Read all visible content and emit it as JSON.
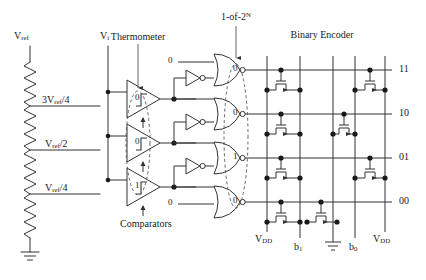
{
  "figure": {
    "kind": "flash-adc-schematic",
    "stroke_color": "#333333",
    "dash_color": "#555555",
    "text_color": "#1a1a1a"
  },
  "section_labels": {
    "thermometer": "Thermometer",
    "one_of_2n_prefix": "1-of-2",
    "one_of_2n_exponent": "N",
    "one_of_2n_mid": "-of-",
    "one_of_2n_lead": "1",
    "binary_encoder": "Binary Encoder",
    "comparators": "Comparators"
  },
  "inputs": {
    "vref_label_v": "V",
    "vref_label_sub": "ref",
    "vi_label_v": "V",
    "vi_label_sub": "i"
  },
  "ladder": {
    "taps": [
      {
        "label_main": "3V",
        "label_sub": "ref",
        "label_tail": "/4"
      },
      {
        "label_main": "V",
        "label_sub": "ref",
        "label_tail": "/2"
      },
      {
        "label_main": "V",
        "label_sub": "ref",
        "label_tail": "/4"
      }
    ]
  },
  "thermometer_code": [
    "0",
    "0",
    "1"
  ],
  "nor_extra_inputs": {
    "top": "0",
    "bottom": "0"
  },
  "one_of_2n_code": [
    "0",
    "0",
    "1",
    "0"
  ],
  "encoder_outputs": [
    "11",
    "10",
    "01",
    "00"
  ],
  "rails": {
    "vdd_left_v": "V",
    "vdd_left_sub": "DD",
    "vdd_right_v": "V",
    "vdd_right_sub": "DD",
    "b1_main": "b",
    "b1_sub": "1",
    "b0_main": "b",
    "b0_sub": "0"
  }
}
